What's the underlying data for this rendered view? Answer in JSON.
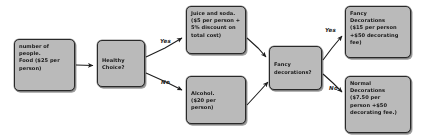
{
  "diagram": {
    "background_color": "#ffffff",
    "node_fill": "#b9b9b9",
    "node_border": "#2b2b2b",
    "nodes": [
      {
        "id": "food",
        "lines": [
          "number of",
          "people.",
          "Food ($25 per",
          "person)"
        ]
      },
      {
        "id": "healthy",
        "lines": [
          "Healthy",
          "Choice?"
        ]
      },
      {
        "id": "juice",
        "lines": [
          "Juice and soda.",
          "($5 per person +",
          "5% discount on",
          "total cost)"
        ]
      },
      {
        "id": "alcohol",
        "lines": [
          "Alcohol.",
          "($20 per",
          "person)"
        ]
      },
      {
        "id": "fancyq",
        "lines": [
          "Fancy",
          "decorations?"
        ]
      },
      {
        "id": "fancydec",
        "lines": [
          "Fancy",
          "Decorations",
          "($15 per person",
          "+$50 decorating",
          "fee)"
        ]
      },
      {
        "id": "normaldec",
        "lines": [
          "Normal",
          "Decorations",
          "($7.50 per",
          "person +$50",
          "decorating fee.)"
        ]
      }
    ],
    "edge_labels": {
      "healthy_yes": "Yes",
      "healthy_no": "No",
      "fancy_yes": "Yes",
      "fancy_no": "No"
    }
  }
}
